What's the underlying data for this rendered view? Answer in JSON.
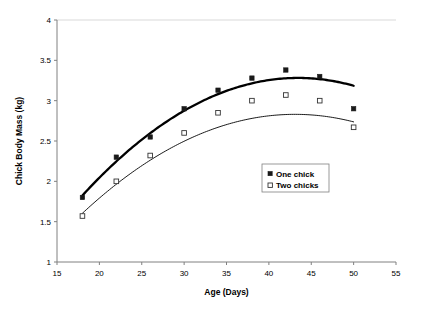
{
  "chart_data": {
    "type": "scatter",
    "title": "",
    "xlabel": "Age (Days)",
    "ylabel": "Chick Body Mass (kg)",
    "xlim": [
      15,
      55
    ],
    "ylim": [
      1,
      4
    ],
    "xticks": [
      15,
      20,
      25,
      30,
      35,
      40,
      45,
      50,
      55
    ],
    "yticks": [
      1,
      1.5,
      2,
      2.5,
      3,
      3.5,
      4
    ],
    "xtick_labels": [
      "15",
      "20",
      "25",
      "30",
      "35",
      "40",
      "45",
      "50",
      "55"
    ],
    "ytick_labels": [
      "1",
      "1.5",
      "2",
      "2.5",
      "3",
      "3.5",
      "4"
    ],
    "grid": false,
    "legend_position": "center-right",
    "series": [
      {
        "name": "One chick",
        "marker": "filled-square",
        "curve": "thick",
        "x": [
          18,
          22,
          26,
          30,
          34,
          38,
          42,
          46,
          50
        ],
        "values": [
          1.8,
          2.3,
          2.55,
          2.9,
          3.13,
          3.28,
          3.38,
          3.3,
          2.9
        ]
      },
      {
        "name": "Two chicks",
        "marker": "open-square",
        "curve": "thin",
        "x": [
          18,
          22,
          26,
          30,
          34,
          38,
          42,
          46,
          50
        ],
        "values": [
          1.57,
          2.0,
          2.32,
          2.6,
          2.85,
          3.0,
          3.07,
          3.0,
          2.67
        ]
      }
    ],
    "fit_curves": [
      {
        "name": "One chick fit",
        "type": "quadratic",
        "x_start": 18,
        "x_end": 50,
        "coefficients": {
          "a": -0.00225,
          "b": 0.1955,
          "c": -0.965
        }
      },
      {
        "name": "Two chicks fit",
        "type": "quadratic",
        "x_start": 18,
        "x_end": 50,
        "coefficients": {
          "a": -0.00195,
          "b": 0.168,
          "c": -0.788
        }
      }
    ]
  },
  "legend": {
    "items": [
      {
        "label": "One chick",
        "marker": "filled-square"
      },
      {
        "label": "Two chicks",
        "marker": "open-square"
      }
    ]
  },
  "colors": {
    "axis": "#808080",
    "marker_filled": "#1a1a1a",
    "marker_open_stroke": "#333333",
    "curve": "#000000",
    "background": "#ffffff",
    "grid_top": "#d9d9d9"
  }
}
